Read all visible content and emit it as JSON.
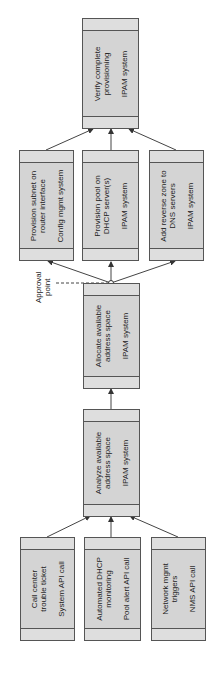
{
  "diagram": {
    "orientation": "rotated-90-ccw",
    "flow_direction": "bottom-to-top",
    "colors": {
      "box_fill": "#d4d4d4",
      "band_fill": "#dedede",
      "border": "#555555",
      "arrow": "#333333"
    },
    "nodes": {
      "call_center": {
        "title": "Call center\ntrouble ticket",
        "system": "System API call"
      },
      "dhcp_monitoring": {
        "title": "Automated DHCP\nmonitoring",
        "system": "Pool alert API call"
      },
      "network_mgmt": {
        "title": "Network mgmt\ntriggers",
        "system": "NMS API call"
      },
      "analyze": {
        "title": "Analyze available\naddress space",
        "system": "IPAM system"
      },
      "allocate": {
        "title": "Allocate available\naddress space",
        "system": "IPAM system"
      },
      "provision_subnet": {
        "title": "Provision subnet on\nrouter interface",
        "system": "Config mgmt system"
      },
      "provision_pool": {
        "title": "Provision pool on\nDHCP server(s)",
        "system": "IPAM system"
      },
      "reverse_zone": {
        "title": "Add reverse zone to\nDNS servers",
        "system": "IPAM system"
      },
      "verify": {
        "title": "Verify complete\nprovisioning",
        "system": "IPAM system"
      }
    },
    "approval_label": "Approval\npoint",
    "edges": [
      [
        "call_center",
        "analyze"
      ],
      [
        "dhcp_monitoring",
        "analyze"
      ],
      [
        "network_mgmt",
        "analyze"
      ],
      [
        "analyze",
        "allocate"
      ],
      [
        "allocate",
        "provision_subnet"
      ],
      [
        "allocate",
        "provision_pool"
      ],
      [
        "allocate",
        "reverse_zone"
      ],
      [
        "provision_subnet",
        "verify"
      ],
      [
        "provision_pool",
        "verify"
      ],
      [
        "reverse_zone",
        "verify"
      ]
    ]
  }
}
